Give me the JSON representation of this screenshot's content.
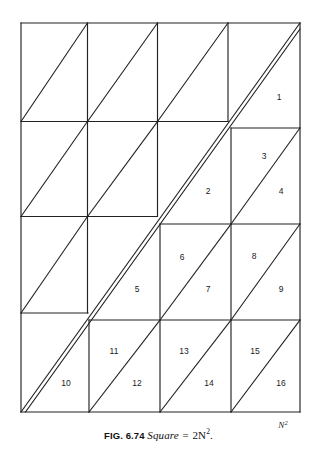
{
  "figure": {
    "caption": {
      "fig_number": "FIG. 6.74",
      "word": "Square",
      "equals": "=",
      "expression": "2N",
      "exponent": "2",
      "period": "."
    },
    "corner_label": {
      "base": "N",
      "exponent": "2"
    },
    "stroke_color": "#222222",
    "background_color": "#ffffff",
    "pieces": [
      {
        "id": 1,
        "label": "1",
        "x": 279,
        "y": 98
      },
      {
        "id": 2,
        "label": "2",
        "x": 208,
        "y": 192
      },
      {
        "id": 3,
        "label": "3",
        "x": 264,
        "y": 157
      },
      {
        "id": 4,
        "label": "4",
        "x": 281,
        "y": 192
      },
      {
        "id": 5,
        "label": "5",
        "x": 137,
        "y": 290
      },
      {
        "id": 6,
        "label": "6",
        "x": 182,
        "y": 258
      },
      {
        "id": 7,
        "label": "7",
        "x": 208,
        "y": 290
      },
      {
        "id": 8,
        "label": "8",
        "x": 254,
        "y": 257
      },
      {
        "id": 9,
        "label": "9",
        "x": 281,
        "y": 290
      },
      {
        "id": 10,
        "label": "10",
        "x": 66,
        "y": 384
      },
      {
        "id": 11,
        "label": "11",
        "x": 114,
        "y": 352
      },
      {
        "id": 12,
        "label": "12",
        "x": 137,
        "y": 384
      },
      {
        "id": 13,
        "label": "13",
        "x": 184,
        "y": 352
      },
      {
        "id": 14,
        "label": "14",
        "x": 209,
        "y": 384
      },
      {
        "id": 15,
        "label": "15",
        "x": 255,
        "y": 352
      },
      {
        "id": 16,
        "label": "16",
        "x": 281,
        "y": 384
      }
    ]
  }
}
